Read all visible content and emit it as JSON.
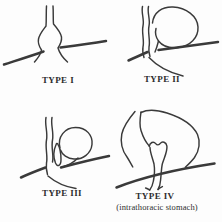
{
  "figure": {
    "background_color": "#fdfdfd",
    "ink_color": "#3a3a3a",
    "panels": [
      {
        "id": "type-1",
        "label": "TYPE I"
      },
      {
        "id": "type-2",
        "label": "TYPE II"
      },
      {
        "id": "type-3",
        "label": "TYPE III"
      },
      {
        "id": "type-4",
        "label": "TYPE IV",
        "sublabel": "(intrathoracic stomach)"
      }
    ]
  }
}
